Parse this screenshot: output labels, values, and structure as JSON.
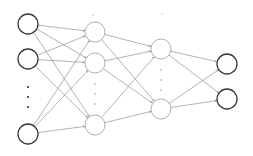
{
  "diagram": {
    "type": "neural-network",
    "colors": {
      "background": "#ffffff",
      "io_node_stroke": "#3a3a3a",
      "hidden_node_stroke": "#a8a8a8",
      "edge": "#a0a0a0",
      "dots": "#333333",
      "hidden_dots": "#9a9a9a"
    },
    "node_radius": 10,
    "layers": [
      {
        "name": "input",
        "kind": "io",
        "x": 28,
        "nodes_y": [
          24,
          59,
          134
        ],
        "ellipsis_y": [
          87,
          97,
          107
        ]
      },
      {
        "name": "hidden-1",
        "kind": "hidden",
        "x": 95,
        "nodes_y": [
          32,
          63,
          125
        ],
        "ellipsis_y": [
          84,
          94,
          104
        ]
      },
      {
        "name": "hidden-2",
        "kind": "hidden",
        "x": 161,
        "nodes_y": [
          49,
          109
        ],
        "ellipsis_y": [
          70,
          80,
          90
        ]
      },
      {
        "name": "output",
        "kind": "io",
        "x": 227,
        "nodes_y": [
          64,
          99
        ],
        "ellipsis_y": []
      }
    ],
    "marks": [
      {
        "x": 93,
        "y": 15
      },
      {
        "x": 162,
        "y": 14
      }
    ]
  }
}
